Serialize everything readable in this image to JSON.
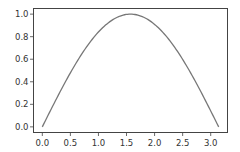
{
  "chart_data": {
    "type": "line",
    "title": "",
    "xlabel": "",
    "ylabel": "",
    "xlim": [
      -0.157,
      3.299
    ],
    "ylim": [
      -0.05,
      1.05
    ],
    "grid": false,
    "legend": null,
    "xticks": [
      "0.0",
      "0.5",
      "1.0",
      "1.5",
      "2.0",
      "2.5",
      "3.0"
    ],
    "yticks": [
      "0.0",
      "0.2",
      "0.4",
      "0.6",
      "0.8",
      "1.0"
    ],
    "series": [
      {
        "name": "sin(x)",
        "color": "#777777",
        "function": "sin(x)",
        "x": [
          0.0,
          0.314,
          0.628,
          0.942,
          1.257,
          1.571,
          1.885,
          2.199,
          2.513,
          2.827,
          3.142
        ],
        "y": [
          0.0,
          0.309,
          0.588,
          0.809,
          0.951,
          1.0,
          0.951,
          0.809,
          0.588,
          0.309,
          0.0
        ]
      }
    ]
  },
  "style": {
    "frame_color": "#444444",
    "line_color": "#777777",
    "text_color": "#333333"
  }
}
